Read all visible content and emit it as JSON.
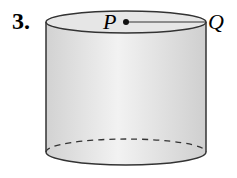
{
  "problem_number": "3.",
  "figure": {
    "shape": "cylinder",
    "points": [
      {
        "label": "P",
        "position": "center of top face"
      },
      {
        "label": "Q",
        "position": "edge of top face"
      }
    ],
    "segment": "PQ (radius)",
    "colors": {
      "fill": "#e2e2e2",
      "stroke": "#333333"
    }
  }
}
